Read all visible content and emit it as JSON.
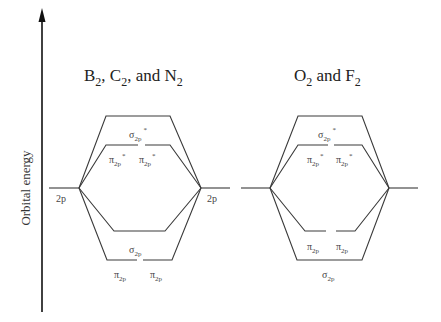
{
  "axis": {
    "label": "Orbital energy",
    "direction": "up"
  },
  "panels": [
    {
      "title_parts": [
        "B",
        "2",
        ", C",
        "2",
        ", and N",
        "2"
      ],
      "title": "B2, C2, and N2",
      "atomic_left": {
        "label": "2p"
      },
      "atomic_right": {
        "label": "2p"
      },
      "mo_levels_top_to_bottom": [
        {
          "name": "σ2p*",
          "symbol": "σ",
          "sub": "2p",
          "sup": "*",
          "count": 1
        },
        {
          "name": "π2p*",
          "symbol": "π",
          "sub": "2p",
          "sup": "*",
          "count": 2
        },
        {
          "name": "σ2p",
          "symbol": "σ",
          "sub": "2p",
          "sup": "",
          "count": 1
        },
        {
          "name": "π2p",
          "symbol": "π",
          "sub": "2p",
          "sup": "",
          "count": 2
        }
      ]
    },
    {
      "title_parts": [
        "O",
        "2",
        " and F",
        "2"
      ],
      "title": "O2 and F2",
      "atomic_left": {
        "label": ""
      },
      "atomic_right": {
        "label": ""
      },
      "mo_levels_top_to_bottom": [
        {
          "name": "σ2p*",
          "symbol": "σ",
          "sub": "2p",
          "sup": "*",
          "count": 1
        },
        {
          "name": "π2p*",
          "symbol": "π",
          "sub": "2p",
          "sup": "*",
          "count": 2
        },
        {
          "name": "π2p",
          "symbol": "π",
          "sub": "2p",
          "sup": "",
          "count": 2
        },
        {
          "name": "σ2p",
          "symbol": "σ",
          "sub": "2p",
          "sup": "",
          "count": 1
        }
      ]
    }
  ],
  "text": {
    "sigma": "σ",
    "pi": "π",
    "sub2p": "2p",
    "star": "*",
    "label_2p": "2p",
    "p1_t1": "B",
    "p1_s1": "2",
    "p1_t2": ", C",
    "p1_s2": "2",
    "p1_t3": ", and N",
    "p1_s3": "2",
    "p2_t1": "O",
    "p2_s1": "2",
    "p2_t2": " and F",
    "p2_s2": "2"
  },
  "colors": {
    "line": "#3a3a3a",
    "text": "#444444",
    "background": "#ffffff"
  }
}
